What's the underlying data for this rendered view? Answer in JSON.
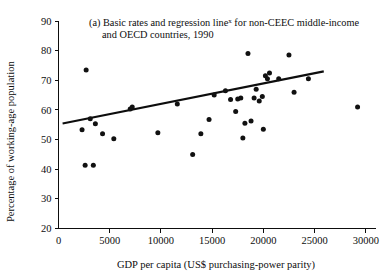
{
  "chart_data": {
    "type": "scatter",
    "title": "(a) Basic rates and regression line",
    "title_superscript": "x",
    "title_rest": " for non-CEEC middle-income",
    "title_line2": "and OECD countries, 1990",
    "xlabel": "GDP per capita (US$ purchasing-power parity)",
    "ylabel": "Percentage of working-age population",
    "xlim": [
      0,
      31000
    ],
    "ylim": [
      20,
      90
    ],
    "xticks": [
      0,
      5000,
      10000,
      15000,
      20000,
      25000,
      30000
    ],
    "xtick_labels": [
      "0",
      "5000",
      "10000",
      "15000",
      "20000",
      "25000",
      "30000"
    ],
    "yticks": [
      20,
      30,
      40,
      50,
      60,
      70,
      80,
      90
    ],
    "ytick_labels": [
      "20",
      "30",
      "40",
      "50",
      "60",
      "70",
      "80",
      "90"
    ],
    "grid": false,
    "legend": "none",
    "marker_color": "#111111",
    "line_color": "#0d0d0d",
    "points": [
      {
        "x": 2300,
        "y": 53.3
      },
      {
        "x": 2600,
        "y": 41.3
      },
      {
        "x": 2700,
        "y": 73.5
      },
      {
        "x": 3100,
        "y": 57.0
      },
      {
        "x": 3400,
        "y": 41.3
      },
      {
        "x": 3600,
        "y": 55.3
      },
      {
        "x": 4300,
        "y": 52.0
      },
      {
        "x": 5400,
        "y": 50.3
      },
      {
        "x": 7000,
        "y": 60.3
      },
      {
        "x": 7200,
        "y": 61.0
      },
      {
        "x": 9700,
        "y": 52.3
      },
      {
        "x": 11600,
        "y": 62.0
      },
      {
        "x": 13100,
        "y": 45.0
      },
      {
        "x": 13900,
        "y": 52.0
      },
      {
        "x": 14700,
        "y": 56.8
      },
      {
        "x": 15200,
        "y": 65.0
      },
      {
        "x": 16300,
        "y": 66.5
      },
      {
        "x": 16800,
        "y": 63.5
      },
      {
        "x": 17300,
        "y": 59.5
      },
      {
        "x": 17500,
        "y": 63.7
      },
      {
        "x": 17800,
        "y": 64.0
      },
      {
        "x": 18000,
        "y": 50.5
      },
      {
        "x": 18200,
        "y": 55.5
      },
      {
        "x": 18500,
        "y": 79.0
      },
      {
        "x": 18800,
        "y": 56.3
      },
      {
        "x": 19100,
        "y": 64.0
      },
      {
        "x": 19300,
        "y": 67.0
      },
      {
        "x": 19600,
        "y": 63.0
      },
      {
        "x": 19900,
        "y": 64.5
      },
      {
        "x": 20000,
        "y": 53.5
      },
      {
        "x": 20200,
        "y": 71.5
      },
      {
        "x": 20400,
        "y": 70.5
      },
      {
        "x": 20600,
        "y": 72.5
      },
      {
        "x": 21500,
        "y": 70.5
      },
      {
        "x": 22500,
        "y": 78.5
      },
      {
        "x": 23000,
        "y": 66.0
      },
      {
        "x": 24400,
        "y": 70.5
      },
      {
        "x": 29200,
        "y": 61.0
      }
    ],
    "regression_line": {
      "x1": 400,
      "y1": 55.4,
      "x2": 25900,
      "y2": 73.0
    }
  },
  "figure": {
    "label_marker": "(a)"
  }
}
